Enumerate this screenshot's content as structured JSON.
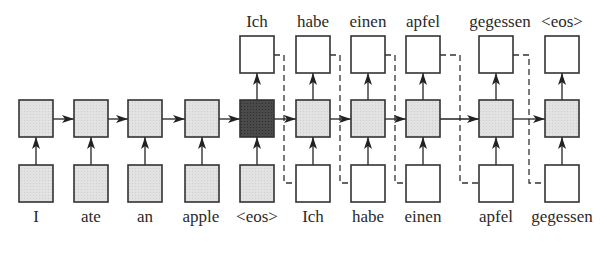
{
  "diagram": {
    "type": "seq2seq-rnn-encoder-decoder",
    "colors": {
      "encoder_fill": "#e4e4e4",
      "context_fill": "#4a4a4a",
      "decoder_hidden_fill": "#e8e8e8",
      "decoder_io_fill": "#ffffff",
      "stroke": "#333333"
    },
    "encoder_inputs": [
      "I",
      "ate",
      "an",
      "apple",
      "<eos>"
    ],
    "decoder_inputs": [
      "Ich",
      "habe",
      "einen",
      "apfel",
      "gegessen"
    ],
    "decoder_outputs": [
      "Ich",
      "habe",
      "einen",
      "apfel",
      "gegessen",
      "<eos>"
    ],
    "bottom_labels": [
      "I",
      "ate",
      "an",
      "apple",
      "<eos>",
      "Ich",
      "habe",
      "einen",
      "apfel",
      "gegessen"
    ],
    "top_labels": [
      "Ich",
      "habe",
      "einen",
      "apfel",
      "gegessen",
      "<eos>"
    ],
    "edges": {
      "recurrent": "solid arrows between hidden states left to right",
      "input_to_hidden": "solid upward arrows",
      "hidden_to_output": "solid upward arrows",
      "feedback": "dashed lines from each decoder output to next decoder input"
    }
  }
}
